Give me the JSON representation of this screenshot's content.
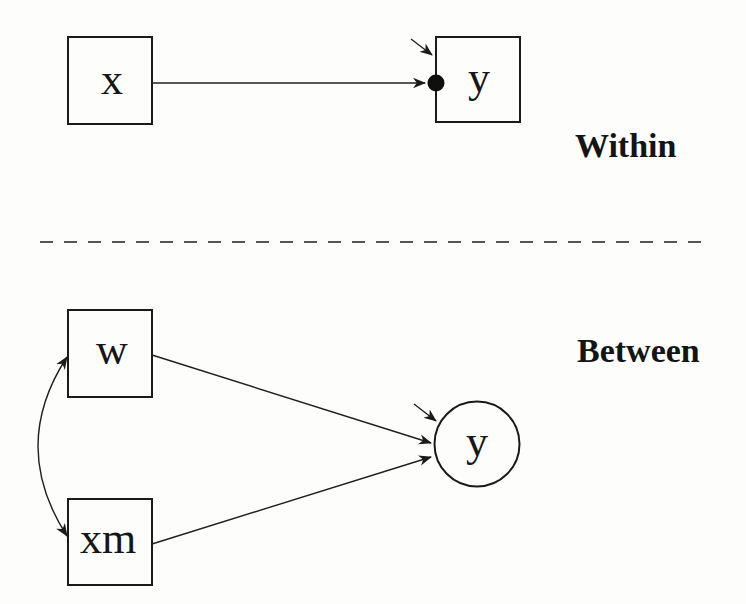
{
  "colors": {
    "background": "#fdfdfc",
    "ink": "#1a1a1a",
    "divider": "#565656"
  },
  "within": {
    "section_label": "Within",
    "x_label": "x",
    "y_label": "y"
  },
  "between": {
    "section_label": "Between",
    "w_label": "w",
    "xm_label": "xm",
    "y_label": "y"
  }
}
